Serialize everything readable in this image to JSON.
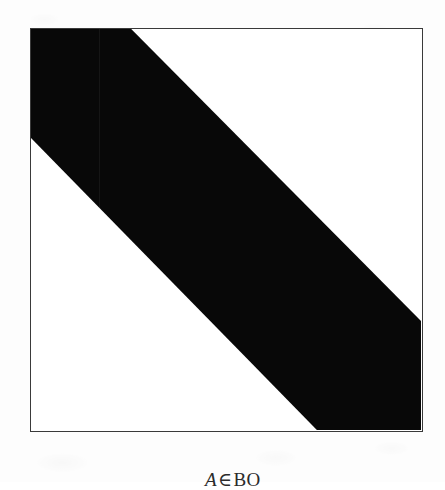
{
  "figure": {
    "caption": {
      "full_text": "A ∈ BO",
      "variable": "A",
      "relation_symbol": "∈",
      "set_name": "BO"
    },
    "frame": {
      "shape": "square",
      "border_color": "#3a3a3a",
      "fill_color": "#ffffff",
      "left": 30,
      "top": 28,
      "width": 393,
      "height": 404
    },
    "background_color": "#fdfdfd"
  },
  "chart_data": {
    "type": "area",
    "subtitle": "",
    "xlabel": "",
    "ylabel": "",
    "grid": false,
    "legend": null,
    "xlim": [
      0,
      1
    ],
    "ylim": [
      0,
      1
    ],
    "shapes": [
      {
        "name": "diagonal-band",
        "kind": "polygon",
        "fill": "#080808",
        "normalized_vertices": [
          [
            0.0,
            0.0
          ],
          [
            0.257,
            0.0
          ],
          [
            1.0,
            0.728
          ],
          [
            1.0,
            1.0
          ],
          [
            0.733,
            1.0
          ],
          [
            0.0,
            0.272
          ]
        ],
        "pixel_vertices": [
          [
            0,
            0
          ],
          [
            101,
            0
          ],
          [
            393,
            294
          ],
          [
            393,
            404
          ],
          [
            288,
            404
          ],
          [
            0,
            110
          ]
        ]
      }
    ],
    "edge_crossings": {
      "top_edge_x": 131,
      "right_edge_y": 322,
      "bottom_edge_x": 318,
      "left_edge_y": 138
    },
    "colors": {
      "band": "#080808",
      "field": "#ffffff",
      "frame_line": "#3a3a3a",
      "paper": "#fdfdfd"
    }
  }
}
